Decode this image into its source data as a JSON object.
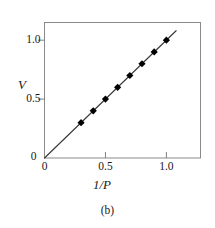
{
  "figure": {
    "caption": "(b)",
    "background_color": "#ffffff",
    "frame_color": "#808080",
    "line_color": "#3a3a3a",
    "marker_color": "#000000"
  },
  "chart_data": {
    "type": "scatter",
    "title": "",
    "subtitle": "",
    "xlabel": "1/P",
    "ylabel": "V",
    "xlim": [
      0,
      1.28
    ],
    "ylim": [
      0,
      1.15
    ],
    "grid": false,
    "legend": null,
    "xticks": [
      0,
      0.5,
      1.0
    ],
    "xtick_labels": [
      "0",
      "0.5",
      "1.0"
    ],
    "yticks": [
      0,
      0.5,
      1.0
    ],
    "ytick_labels": [
      "0",
      "0.5",
      "1.0"
    ],
    "series": [
      {
        "name": "V vs 1/P",
        "marker": "diamond",
        "x": [
          0.3,
          0.4,
          0.5,
          0.6,
          0.7,
          0.8,
          0.9,
          1.0
        ],
        "y": [
          0.3,
          0.4,
          0.5,
          0.6,
          0.7,
          0.8,
          0.9,
          1.0
        ]
      }
    ],
    "fit_line": {
      "name": "linear fit through origin",
      "slope": 1.0,
      "intercept": 0.0,
      "x_start": 0.0,
      "y_start": 0.0,
      "x_end": 1.08,
      "y_end": 1.08
    },
    "annotations": []
  }
}
